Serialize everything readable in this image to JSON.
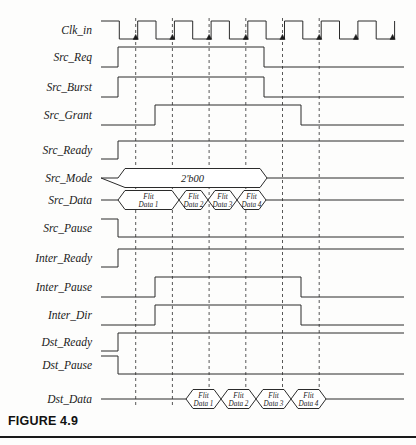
{
  "figure": {
    "caption": "FIGURE 4.9",
    "type": "digital-timing-waveform-diagram"
  },
  "geometry": {
    "wave_left": 101,
    "wave_right": 404,
    "grid_start": 135.7,
    "grid_spacing": 36.7,
    "grid_count": 6,
    "grid_top": 18,
    "grid_bottom": 408,
    "stroke": "#2b2b2b",
    "grid_color": "#3a3a3a"
  },
  "clock": {
    "name": "Clk_in",
    "y": 30,
    "start_x": 101,
    "period": 36.7,
    "high_width": 18.3,
    "cycles": 8,
    "amplitude": 18,
    "arrow_marker": "rising-edge-arrow"
  },
  "signals": [
    {
      "name": "Src_Req",
      "label": "Src_Req",
      "y": 57,
      "type": "level",
      "rise_x": 118,
      "fall_x": 264,
      "height": 20
    },
    {
      "name": "Src_Burst",
      "label": "Src_Burst",
      "y": 87,
      "type": "level",
      "rise_x": 118,
      "fall_x": 264,
      "height": 20
    },
    {
      "name": "Src_Grant",
      "label": "Src_Grant",
      "y": 115,
      "type": "level",
      "rise_x": 155,
      "fall_x": 301,
      "height": 20
    },
    {
      "name": "Src_Ready",
      "label": "Src_Ready",
      "y": 150,
      "type": "level",
      "rise_x": 118,
      "fall_x": null,
      "height": 18
    },
    {
      "name": "Src_Mode",
      "label": "Src_Mode",
      "y": 178,
      "type": "bus",
      "value": "2'b00",
      "start_x": 118,
      "end_x": 267,
      "height": 19
    },
    {
      "name": "Src_Data",
      "label": "Src_Data",
      "y": 200,
      "type": "bus-sequence",
      "start_x": 118,
      "end_x": 265,
      "height": 19,
      "cells": [
        {
          "line1": "Flit",
          "line2": "Data 1",
          "x0": 118,
          "x1": 179
        },
        {
          "line1": "Flit",
          "line2": "Data 2",
          "x0": 179,
          "x1": 208
        },
        {
          "line1": "Flit",
          "line2": "Data 3",
          "x0": 208,
          "x1": 237
        },
        {
          "line1": "Flit",
          "line2": "Data 4",
          "x0": 237,
          "x1": 266
        }
      ]
    },
    {
      "name": "Src_Pause",
      "label": "Src_Pause",
      "y": 228,
      "type": "level-inverted",
      "fall_x": 118,
      "height": 18
    },
    {
      "name": "Inter_Ready",
      "label": "Inter_Ready",
      "y": 258,
      "type": "level",
      "rise_x": 118,
      "fall_x": null,
      "height": 18
    },
    {
      "name": "Inter_Pause",
      "label": "Inter_Pause",
      "y": 287,
      "type": "level",
      "rise_x": 155,
      "fall_x": 301,
      "height": 20
    },
    {
      "name": "Inter_Dir",
      "label": "Inter_Dir",
      "y": 315,
      "type": "level",
      "rise_x": 155,
      "fall_x": 301,
      "height": 20
    },
    {
      "name": "Dst_Ready",
      "label": "Dst_Ready",
      "y": 342,
      "type": "level",
      "rise_x": 118,
      "fall_x": null,
      "height": 18
    },
    {
      "name": "Dst_Pause",
      "label": "Dst_Pause",
      "y": 365,
      "type": "level-inverted",
      "fall_x": 118,
      "height": 18
    },
    {
      "name": "Dst_Data",
      "label": "Dst_Data",
      "y": 399,
      "type": "bus-sequence",
      "start_x": 186,
      "end_x": 325,
      "height": 19,
      "cells": [
        {
          "line1": "Flit",
          "line2": "Data 1",
          "x0": 186,
          "x1": 221
        },
        {
          "line1": "Flit",
          "line2": "Data 2",
          "x0": 221,
          "x1": 256
        },
        {
          "line1": "Flit",
          "line2": "Data 3",
          "x0": 256,
          "x1": 291
        },
        {
          "line1": "Flit",
          "line2": "Data 4",
          "x0": 291,
          "x1": 326
        }
      ]
    }
  ],
  "labels": {
    "clk": "Clk_in",
    "src_req": "Src_Req",
    "src_burst": "Src_Burst",
    "src_grant": "Src_Grant",
    "src_ready": "Src_Ready",
    "src_mode": "Src_Mode",
    "src_data": "Src_Data",
    "src_pause": "Src_Pause",
    "inter_ready": "Inter_Ready",
    "inter_pause": "Inter_Pause",
    "inter_dir": "Inter_Dir",
    "dst_ready": "Dst_Ready",
    "dst_pause": "Dst_Pause",
    "dst_data": "Dst_Data"
  },
  "bus_values": {
    "src_mode": "2'b00",
    "flit": "Flit",
    "data1": "Data 1",
    "data2": "Data 2",
    "data3": "Data 3",
    "data4": "Data 4"
  }
}
